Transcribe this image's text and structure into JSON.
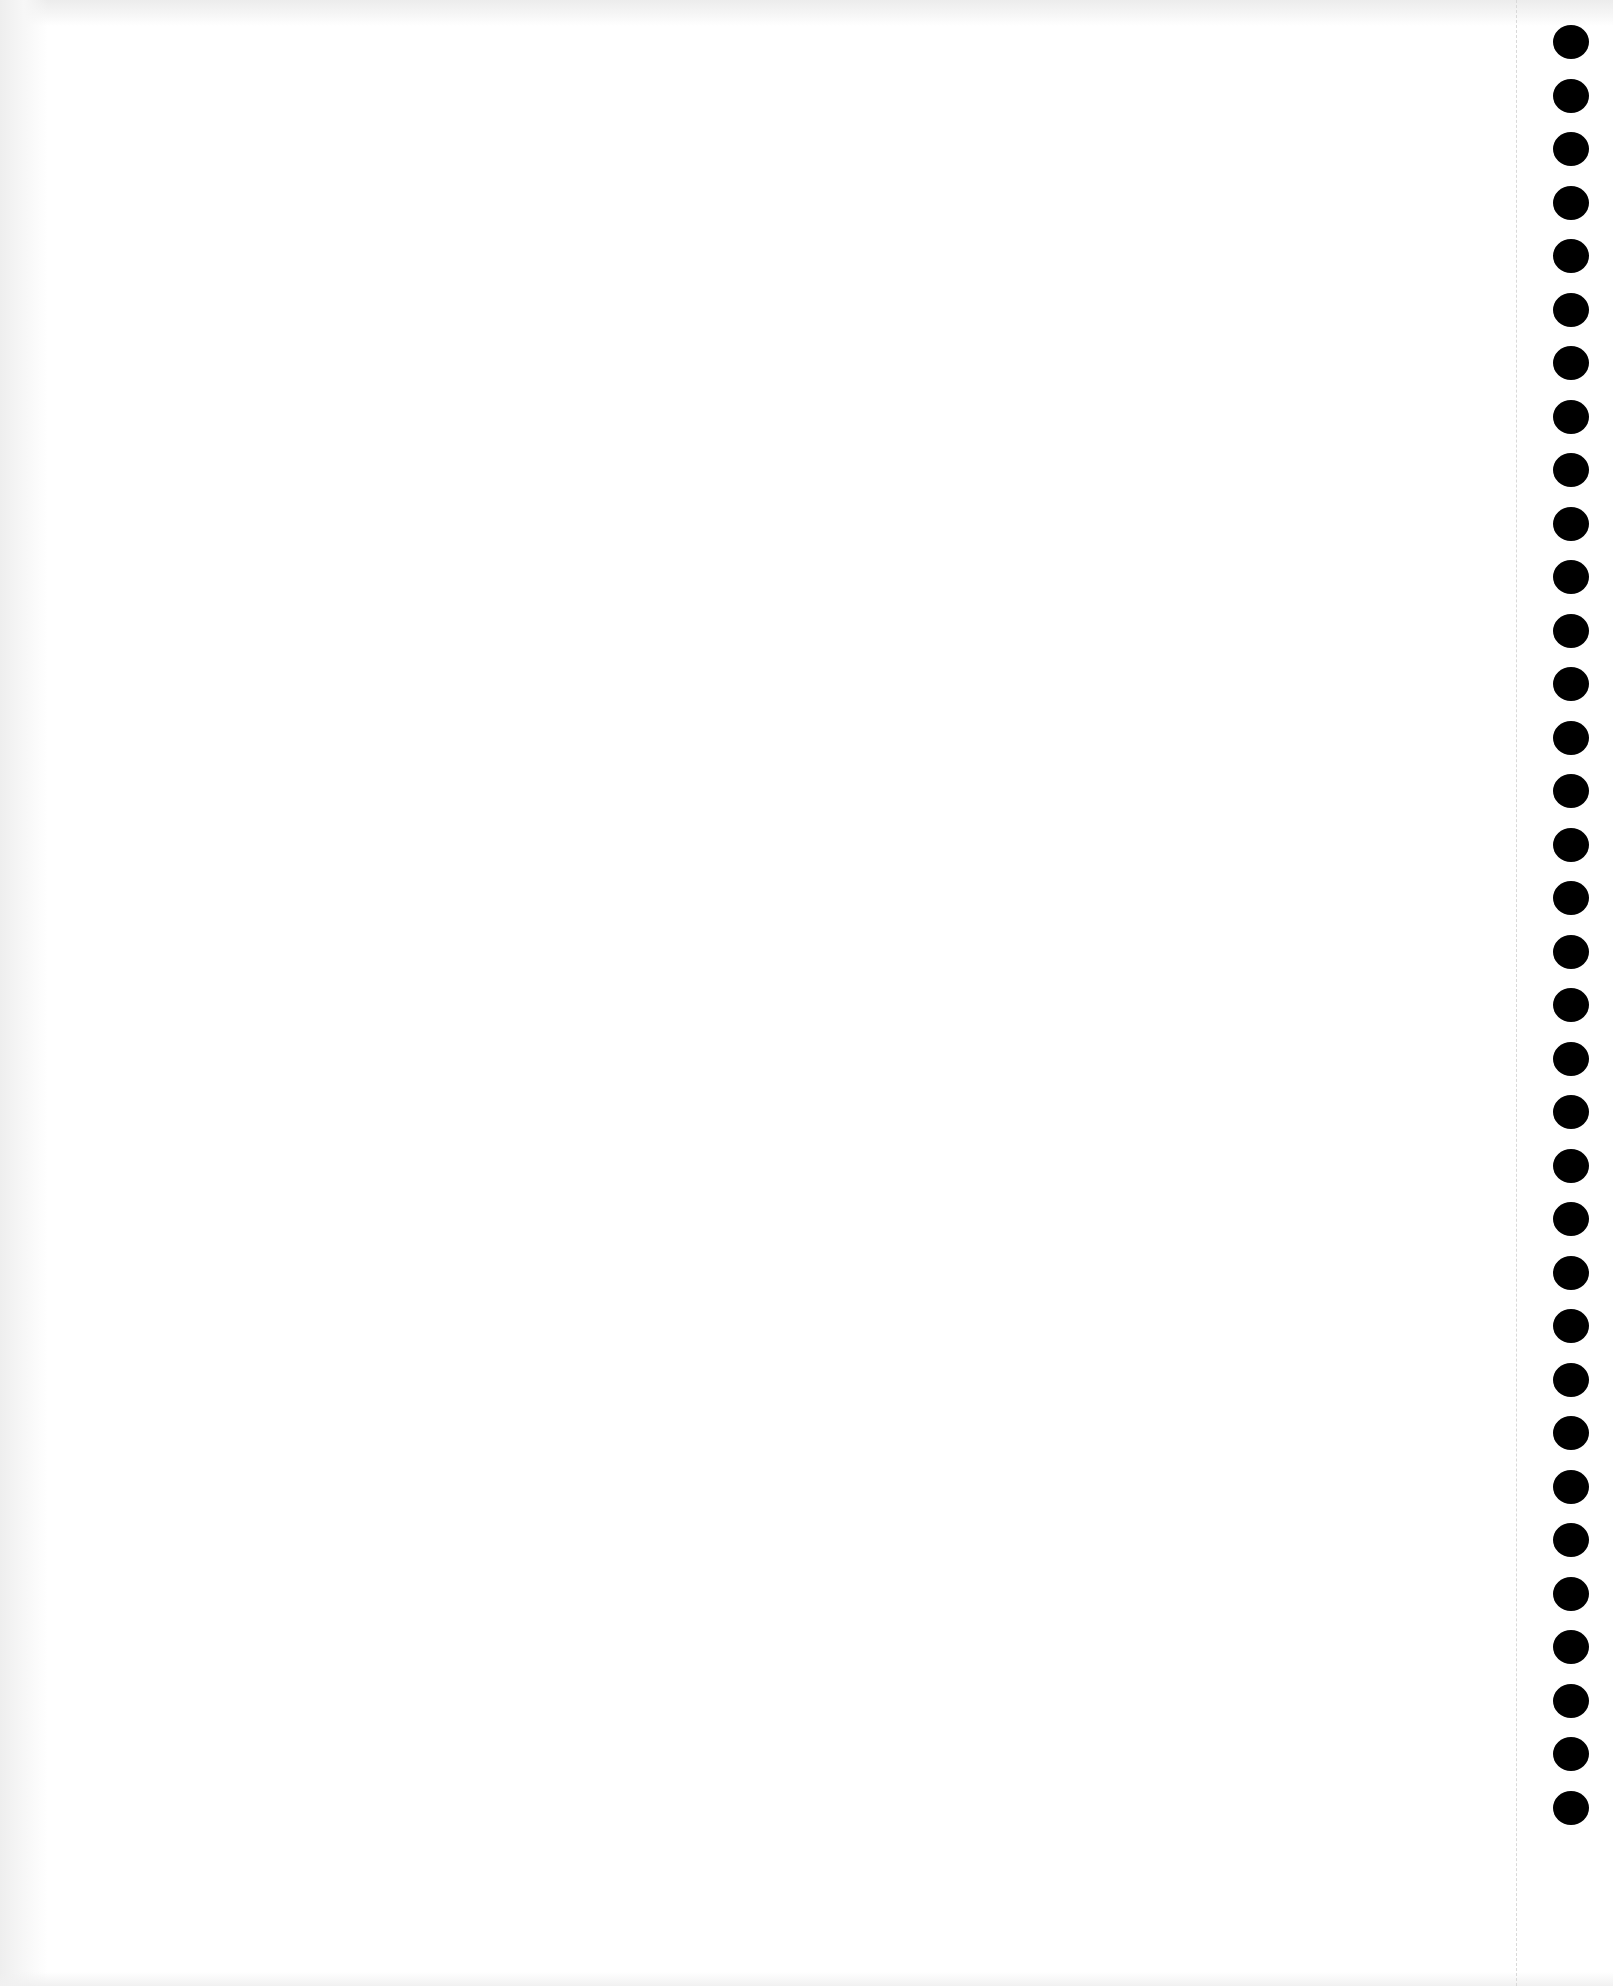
{
  "page": {
    "width": 1613,
    "height": 1986,
    "background_color": "#ffffff",
    "edge_shadow_color": "#ececec",
    "text_content": []
  },
  "perforation": {
    "x": 1516,
    "color": "#d9d9d9",
    "style": "dashed"
  },
  "punch_holes": {
    "count": 34,
    "center_x": 1571,
    "first_center_y": 42,
    "spacing_y": 53.5,
    "width": 36,
    "height": 34,
    "color": "#000000"
  }
}
